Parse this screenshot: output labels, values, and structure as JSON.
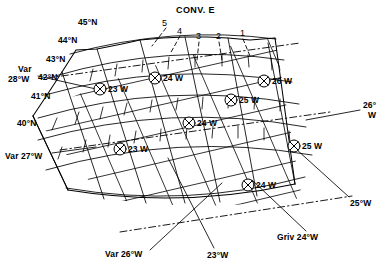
{
  "figure": {
    "type": "navigation-grid-chart",
    "title": "CONV. E"
  },
  "latitude_labels": [
    {
      "text": "45°N",
      "x": 78,
      "y": 18
    },
    {
      "text": "44°N",
      "x": 58,
      "y": 36
    },
    {
      "text": "43°N",
      "x": 46,
      "y": 55
    },
    {
      "text": "42°N",
      "x": 38,
      "y": 73
    },
    {
      "text": "41°N",
      "x": 31,
      "y": 92
    },
    {
      "text": "40°N",
      "x": 17,
      "y": 119
    }
  ],
  "grid_meridian_numbers": [
    {
      "text": "5",
      "x": 162,
      "y": 22
    },
    {
      "text": "4",
      "x": 177,
      "y": 30
    },
    {
      "text": "3",
      "x": 196,
      "y": 35
    },
    {
      "text": "2",
      "x": 216,
      "y": 35
    },
    {
      "text": "1",
      "x": 240,
      "y": 32
    }
  ],
  "variation_labels": [
    {
      "text": "Var",
      "x": 18,
      "y": 67
    },
    {
      "text": "28°W",
      "x": 10,
      "y": 77
    },
    {
      "text": "Var 27°W",
      "x": 6,
      "y": 155
    },
    {
      "text": "Var 26°W",
      "x": 107,
      "y": 254
    }
  ],
  "edge_longitude_labels": [
    {
      "text": "26°",
      "x": 363,
      "y": 106
    },
    {
      "text": "W",
      "x": 368,
      "y": 116
    },
    {
      "text": "25°W",
      "x": 352,
      "y": 203
    },
    {
      "text": "23°W",
      "x": 207,
      "y": 255
    }
  ],
  "grivation_label": {
    "text": "Griv 24°W",
    "x": 278,
    "y": 237
  },
  "fix_points": [
    {
      "name": "fix-23w-upper",
      "label": "23 W",
      "cx": 100,
      "cy": 89,
      "lx": 108,
      "ly": 90
    },
    {
      "name": "fix-24w-upper",
      "label": "24 W",
      "cx": 155,
      "cy": 78,
      "lx": 163,
      "ly": 79
    },
    {
      "name": "fix-26w",
      "label": "26 W",
      "cx": 264,
      "cy": 81,
      "lx": 272,
      "ly": 82
    },
    {
      "name": "fix-25w-upper",
      "label": "25 W",
      "cx": 231,
      "cy": 100,
      "lx": 239,
      "ly": 101
    },
    {
      "name": "fix-24w-center",
      "label": "24 W",
      "cx": 189,
      "cy": 123,
      "lx": 197,
      "ly": 124
    },
    {
      "name": "fix-23w-lower",
      "label": "23 W",
      "cx": 120,
      "cy": 149,
      "lx": 128,
      "ly": 150
    },
    {
      "name": "fix-25w-lower",
      "label": "25 W",
      "cx": 294,
      "cy": 146,
      "lx": 302,
      "ly": 147
    },
    {
      "name": "fix-24w-lower",
      "label": "24 W",
      "cx": 248,
      "cy": 185,
      "lx": 256,
      "ly": 186
    }
  ],
  "colors": {
    "line": "#000000",
    "background": "#ffffff",
    "text": "#000000"
  }
}
